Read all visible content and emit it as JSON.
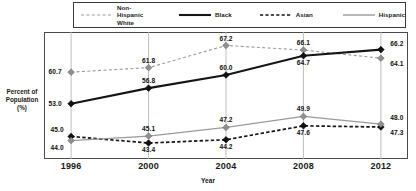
{
  "chart_data": {
    "type": "line",
    "title": "",
    "xlabel": "Year",
    "ylabel": "Percent of\nPopulation\n(%)",
    "categories": [
      "1996",
      "2000",
      "2004",
      "2008",
      "2012"
    ],
    "x": [
      1996,
      2000,
      2004,
      2008,
      2012
    ],
    "xlim": [
      1994.6,
      2013.4
    ],
    "ylim": [
      39.5,
      70.5
    ],
    "grid": "vertical-only",
    "legend_position": "top",
    "series": [
      {
        "name": "Non-Hispanic White",
        "legend_label": "Non-Hispanic\nWhite",
        "style": "dashed",
        "color": "#9a9a9a",
        "marker": "diamond",
        "marker_color": "#8f8f8f",
        "values": [
          60.7,
          61.8,
          67.2,
          66.1,
          64.1
        ],
        "labels": [
          "60.7",
          "61.8",
          "67.2",
          "66.1",
          "64.1"
        ],
        "label_positions": [
          "left",
          "above",
          "above",
          "above",
          "below-right"
        ]
      },
      {
        "name": "Black",
        "legend_label": "Black",
        "style": "solid",
        "color": "#151515",
        "marker": "diamond",
        "marker_color": "#111111",
        "values": [
          53.0,
          56.8,
          60.0,
          64.7,
          66.2
        ],
        "labels": [
          "53.0",
          "56.8",
          "60.0",
          "64.7",
          "66.2"
        ],
        "label_positions": [
          "left",
          "above",
          "above",
          "below",
          "above-right"
        ]
      },
      {
        "name": "Asian",
        "legend_label": "Asian",
        "style": "dashed",
        "color": "#151515",
        "marker": "diamond",
        "marker_color": "#111111",
        "values": [
          45.0,
          43.4,
          44.2,
          47.6,
          47.3
        ],
        "labels": [
          "45.0",
          "43.4",
          "44.2",
          "47.6",
          "47.3"
        ],
        "label_positions": [
          "above-left",
          "below",
          "below",
          "below",
          "below-right"
        ]
      },
      {
        "name": "Hispanic",
        "legend_label": "Hispanic",
        "style": "solid",
        "color": "#9a9a9a",
        "marker": "diamond",
        "marker_color": "#8f8f8f",
        "values": [
          44.0,
          45.1,
          47.2,
          49.9,
          48.0
        ],
        "labels": [
          "44.0",
          "45.1",
          "47.2",
          "49.9",
          "48.0"
        ],
        "label_positions": [
          "below-left",
          "above",
          "above",
          "above",
          "above-right"
        ]
      }
    ]
  },
  "legend": {
    "entries": [
      {
        "label": "Non-Hispanic\nWhite"
      },
      {
        "label": "Black"
      },
      {
        "label": "Asian"
      },
      {
        "label": "Hispanic"
      }
    ]
  },
  "axes": {
    "y_title": "Percent of\nPopulation\n(%)",
    "x_title": "Year",
    "x_ticks": [
      "1996",
      "2000",
      "2004",
      "2008",
      "2012"
    ]
  },
  "colors": {
    "gray_series": "#9a9a9a",
    "black_series": "#151515",
    "frame": "#4a4a4a",
    "gridline": "#b8b8b8",
    "background": "#ffffff"
  }
}
